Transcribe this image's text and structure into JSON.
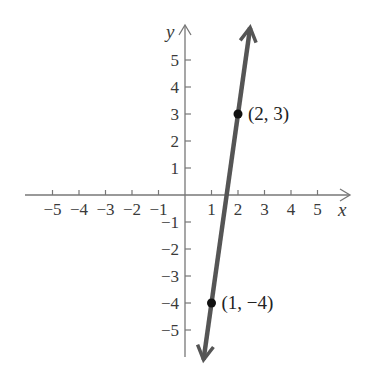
{
  "chart_data": {
    "type": "line",
    "title": "",
    "xlabel": "x",
    "ylabel": "y",
    "xlim": [
      -5.8,
      6.2
    ],
    "ylim": [
      -6.1,
      6.3
    ],
    "grid": false,
    "x_ticks": [
      -5,
      -4,
      -3,
      -2,
      -1,
      1,
      2,
      3,
      4,
      5
    ],
    "y_ticks": [
      5,
      4,
      3,
      2,
      1,
      -1,
      -2,
      -3,
      -4,
      -5
    ],
    "x_tick_labels": [
      "−5",
      "−4",
      "−3",
      "−2",
      "−1",
      "1",
      "2",
      "3",
      "4",
      "5"
    ],
    "y_tick_labels": [
      "5",
      "4",
      "3",
      "2",
      "1",
      "−1",
      "−2",
      "−3",
      "−4",
      "−5"
    ],
    "series": [
      {
        "name": "line through (1, −4) and (2, 3)",
        "equation": "y = 7x − 11",
        "slope": 7,
        "intercept": -11,
        "arrows": "both",
        "color": "#555555"
      }
    ],
    "points": [
      {
        "x": 2,
        "y": 3,
        "label": "(2, 3)"
      },
      {
        "x": 1,
        "y": -4,
        "label": "(1, −4)"
      }
    ],
    "axis_color": "#777777",
    "point_color": "#111111"
  }
}
